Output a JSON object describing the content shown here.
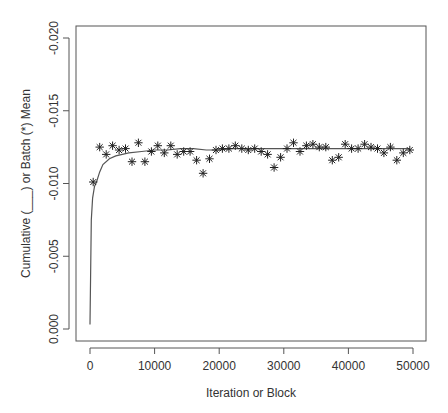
{
  "chart_data": {
    "type": "line",
    "title": "",
    "xlabel": "Iteration or Block",
    "ylabel": "Cumulative (___) or Batch (*) Mean",
    "xlim": [
      -2200,
      52000
    ],
    "ylim": [
      0.0008,
      -0.0208
    ],
    "y_axis_reversed": true,
    "grid": false,
    "legend": "none",
    "x_ticks": [
      0,
      10000,
      20000,
      30000,
      40000,
      50000
    ],
    "x_tick_labels": [
      "0",
      "10000",
      "20000",
      "30000",
      "40000",
      "50000"
    ],
    "y_ticks": [
      0.0,
      -0.005,
      -0.01,
      -0.015,
      -0.02
    ],
    "y_tick_labels": [
      "0.000",
      "-0.005",
      "-0.010",
      "-0.015",
      "-0.020"
    ],
    "series": [
      {
        "name": "Cumulative mean",
        "style": "line",
        "x": [
          0,
          200,
          400,
          700,
          1000,
          1500,
          2000,
          3000,
          4000,
          5000,
          6000,
          8000,
          10000,
          12000,
          14000,
          16000,
          18000,
          20000,
          22000,
          24000,
          26000,
          28000,
          30000,
          32000,
          34000,
          36000,
          38000,
          40000,
          42000,
          44000,
          46000,
          48000,
          49500
        ],
        "values": [
          -0.0003,
          -0.0075,
          -0.009,
          -0.0098,
          -0.0101,
          -0.0108,
          -0.0113,
          -0.0117,
          -0.0119,
          -0.012,
          -0.0121,
          -0.0122,
          -0.0123,
          -0.0123,
          -0.0124,
          -0.0124,
          -0.0123,
          -0.0123,
          -0.0124,
          -0.0124,
          -0.0124,
          -0.0124,
          -0.0124,
          -0.0124,
          -0.0124,
          -0.0124,
          -0.0124,
          -0.0124,
          -0.0124,
          -0.0124,
          -0.0124,
          -0.0124,
          -0.0124
        ]
      },
      {
        "name": "Batch mean",
        "style": "asterisk",
        "x": [
          500,
          1500,
          2500,
          3500,
          4500,
          5500,
          6500,
          7500,
          8500,
          9500,
          10500,
          11500,
          12500,
          13500,
          14500,
          15500,
          16500,
          17500,
          18500,
          19500,
          20500,
          21500,
          22500,
          23500,
          24500,
          25500,
          26500,
          27500,
          28500,
          29500,
          30500,
          31500,
          32500,
          33500,
          34500,
          35500,
          36500,
          37500,
          38500,
          39500,
          40500,
          41500,
          42500,
          43500,
          44500,
          45500,
          46500,
          47500,
          48500,
          49500
        ],
        "values": [
          -0.0101,
          -0.0125,
          -0.012,
          -0.0126,
          -0.0123,
          -0.0124,
          -0.0115,
          -0.0128,
          -0.0115,
          -0.0122,
          -0.0126,
          -0.0121,
          -0.0126,
          -0.012,
          -0.0122,
          -0.0122,
          -0.0116,
          -0.0107,
          -0.0117,
          -0.0123,
          -0.0124,
          -0.0124,
          -0.0126,
          -0.0124,
          -0.0123,
          -0.0124,
          -0.0122,
          -0.012,
          -0.0111,
          -0.0118,
          -0.0124,
          -0.0128,
          -0.0122,
          -0.0126,
          -0.0127,
          -0.0125,
          -0.0125,
          -0.0116,
          -0.0118,
          -0.0127,
          -0.0124,
          -0.0124,
          -0.0127,
          -0.0125,
          -0.0124,
          -0.0121,
          -0.0125,
          -0.0116,
          -0.0121,
          -0.0123
        ]
      }
    ]
  },
  "colors": {
    "axis": "#555555",
    "line": "#555555",
    "marker": "#222222",
    "text": "#333333"
  }
}
